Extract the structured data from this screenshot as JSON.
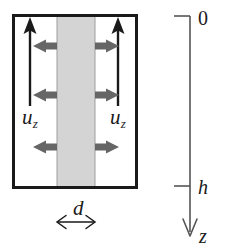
{
  "figure": {
    "type": "schematic-diagram",
    "colors": {
      "stroke": "#1a1a1a",
      "band_fill": "#d4d4d4",
      "band_stroke": "#9a9a9a",
      "arrow_gray": "#666666",
      "axis": "#555555",
      "background": "#ffffff"
    },
    "labels": {
      "velocity_left": {
        "base": "u",
        "sub": "z"
      },
      "velocity_right": {
        "base": "u",
        "sub": "z"
      },
      "thickness": "d",
      "axis_origin": "0",
      "axis_depth": "h",
      "axis_name": "z"
    },
    "elements": {
      "outer_box": {
        "x": 13,
        "y": 15,
        "width": 124,
        "height": 173
      },
      "gray_band": {
        "x": 57,
        "y": 15,
        "width": 38,
        "height": 173
      },
      "vertical_arrow_left": {
        "x": 30,
        "y_tail": 106,
        "y_head": 20,
        "direction": "up"
      },
      "vertical_arrow_right": {
        "x": 118,
        "y_tail": 106,
        "y_head": 20,
        "direction": "up"
      },
      "horizontal_arrow_rows": [
        46,
        95,
        147
      ],
      "horizontal_arrow_left_direction": "left",
      "horizontal_arrow_right_direction": "right",
      "thickness_arrow": {
        "x_left": 56,
        "x_right": 96,
        "y": 222,
        "heads": "both"
      },
      "depth_axis": {
        "x": 190,
        "y_top": 16,
        "y_bottom": 237,
        "direction": "down"
      },
      "ticks": [
        {
          "label": "0",
          "y": 16
        },
        {
          "label": "h",
          "y": 186
        }
      ]
    }
  }
}
